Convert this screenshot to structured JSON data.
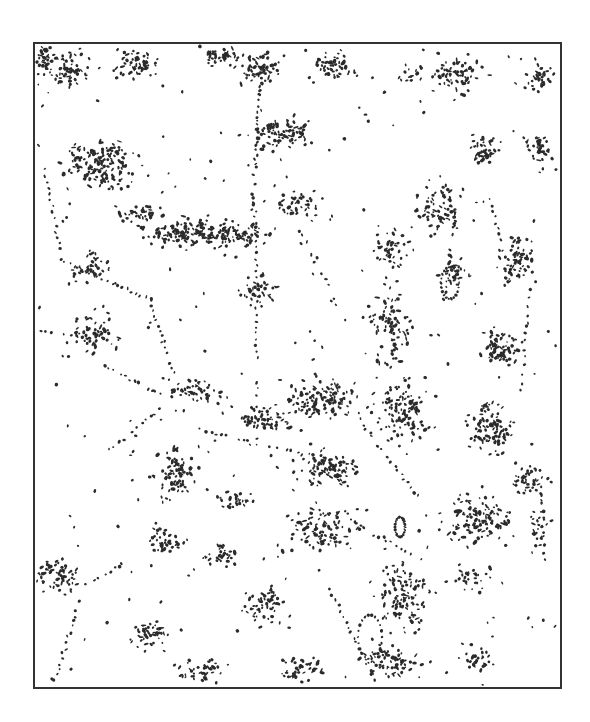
{
  "map": {
    "type": "binary-settlement-pattern",
    "frame": {
      "x": 34,
      "y": 43,
      "width": 527,
      "height": 645,
      "stroke": "#333333",
      "stroke_width": 2
    },
    "colors": {
      "background": "#ffffff",
      "ink": "#2b2b2b",
      "frame": "#333333"
    },
    "clusters": [
      {
        "cx": 100,
        "cy": 165,
        "rx": 40,
        "ry": 28,
        "n": 170
      },
      {
        "cx": 70,
        "cy": 70,
        "rx": 25,
        "ry": 20,
        "n": 60
      },
      {
        "cx": 45,
        "cy": 60,
        "rx": 10,
        "ry": 15,
        "n": 25
      },
      {
        "cx": 135,
        "cy": 62,
        "rx": 28,
        "ry": 18,
        "n": 55
      },
      {
        "cx": 220,
        "cy": 55,
        "rx": 22,
        "ry": 12,
        "n": 45
      },
      {
        "cx": 260,
        "cy": 65,
        "rx": 25,
        "ry": 20,
        "n": 55
      },
      {
        "cx": 335,
        "cy": 65,
        "rx": 25,
        "ry": 18,
        "n": 50
      },
      {
        "cx": 410,
        "cy": 75,
        "rx": 15,
        "ry": 12,
        "n": 15
      },
      {
        "cx": 455,
        "cy": 75,
        "rx": 30,
        "ry": 20,
        "n": 65
      },
      {
        "cx": 485,
        "cy": 150,
        "rx": 18,
        "ry": 15,
        "n": 45
      },
      {
        "cx": 540,
        "cy": 75,
        "rx": 15,
        "ry": 20,
        "n": 35
      },
      {
        "cx": 540,
        "cy": 150,
        "rx": 15,
        "ry": 25,
        "n": 40
      },
      {
        "cx": 190,
        "cy": 232,
        "rx": 50,
        "ry": 18,
        "n": 140
      },
      {
        "cx": 140,
        "cy": 215,
        "rx": 30,
        "ry": 14,
        "n": 40
      },
      {
        "cx": 280,
        "cy": 135,
        "rx": 30,
        "ry": 20,
        "n": 80
      },
      {
        "cx": 240,
        "cy": 235,
        "rx": 30,
        "ry": 15,
        "n": 60
      },
      {
        "cx": 300,
        "cy": 205,
        "rx": 22,
        "ry": 12,
        "n": 35
      },
      {
        "cx": 260,
        "cy": 290,
        "rx": 25,
        "ry": 20,
        "n": 40
      },
      {
        "cx": 440,
        "cy": 205,
        "rx": 25,
        "ry": 30,
        "n": 75
      },
      {
        "cx": 390,
        "cy": 250,
        "rx": 20,
        "ry": 25,
        "n": 45
      },
      {
        "cx": 515,
        "cy": 260,
        "rx": 20,
        "ry": 30,
        "n": 70
      },
      {
        "cx": 455,
        "cy": 270,
        "rx": 15,
        "ry": 20,
        "n": 30
      },
      {
        "cx": 500,
        "cy": 350,
        "rx": 22,
        "ry": 25,
        "n": 70
      },
      {
        "cx": 490,
        "cy": 430,
        "rx": 25,
        "ry": 30,
        "n": 95
      },
      {
        "cx": 390,
        "cy": 330,
        "rx": 25,
        "ry": 45,
        "n": 90
      },
      {
        "cx": 400,
        "cy": 410,
        "rx": 35,
        "ry": 35,
        "n": 120
      },
      {
        "cx": 320,
        "cy": 400,
        "rx": 45,
        "ry": 25,
        "n": 130
      },
      {
        "cx": 260,
        "cy": 420,
        "rx": 30,
        "ry": 15,
        "n": 60
      },
      {
        "cx": 330,
        "cy": 470,
        "rx": 40,
        "ry": 20,
        "n": 80
      },
      {
        "cx": 195,
        "cy": 390,
        "rx": 30,
        "ry": 15,
        "n": 55
      },
      {
        "cx": 90,
        "cy": 265,
        "rx": 25,
        "ry": 20,
        "n": 40
      },
      {
        "cx": 95,
        "cy": 335,
        "rx": 28,
        "ry": 22,
        "n": 55
      },
      {
        "cx": 175,
        "cy": 475,
        "rx": 25,
        "ry": 30,
        "n": 85
      },
      {
        "cx": 165,
        "cy": 540,
        "rx": 22,
        "ry": 18,
        "n": 40
      },
      {
        "cx": 55,
        "cy": 575,
        "rx": 25,
        "ry": 20,
        "n": 65
      },
      {
        "cx": 150,
        "cy": 635,
        "rx": 22,
        "ry": 18,
        "n": 45
      },
      {
        "cx": 220,
        "cy": 555,
        "rx": 20,
        "ry": 14,
        "n": 30
      },
      {
        "cx": 235,
        "cy": 500,
        "rx": 25,
        "ry": 10,
        "n": 25
      },
      {
        "cx": 265,
        "cy": 605,
        "rx": 25,
        "ry": 25,
        "n": 55
      },
      {
        "cx": 320,
        "cy": 530,
        "rx": 40,
        "ry": 25,
        "n": 85
      },
      {
        "cx": 405,
        "cy": 600,
        "rx": 30,
        "ry": 40,
        "n": 110
      },
      {
        "cx": 390,
        "cy": 660,
        "rx": 35,
        "ry": 18,
        "n": 70
      },
      {
        "cx": 300,
        "cy": 670,
        "rx": 30,
        "ry": 14,
        "n": 45
      },
      {
        "cx": 200,
        "cy": 670,
        "rx": 25,
        "ry": 12,
        "n": 40
      },
      {
        "cx": 480,
        "cy": 520,
        "rx": 40,
        "ry": 30,
        "n": 120
      },
      {
        "cx": 530,
        "cy": 480,
        "rx": 22,
        "ry": 20,
        "n": 45
      },
      {
        "cx": 540,
        "cy": 530,
        "rx": 12,
        "ry": 25,
        "n": 25
      },
      {
        "cx": 470,
        "cy": 580,
        "rx": 25,
        "ry": 12,
        "n": 25
      },
      {
        "cx": 475,
        "cy": 660,
        "rx": 20,
        "ry": 15,
        "n": 25
      }
    ],
    "lines": [
      {
        "x1": 262,
        "y1": 65,
        "x2": 252,
        "y2": 210,
        "n": 35
      },
      {
        "x1": 255,
        "y1": 210,
        "x2": 258,
        "y2": 450,
        "n": 40
      },
      {
        "x1": 45,
        "y1": 170,
        "x2": 60,
        "y2": 250,
        "n": 14
      },
      {
        "x1": 60,
        "y1": 260,
        "x2": 150,
        "y2": 300,
        "n": 20
      },
      {
        "x1": 150,
        "y1": 300,
        "x2": 185,
        "y2": 410,
        "n": 22
      },
      {
        "x1": 105,
        "y1": 365,
        "x2": 160,
        "y2": 395,
        "n": 14
      },
      {
        "x1": 40,
        "y1": 330,
        "x2": 95,
        "y2": 340,
        "n": 10
      },
      {
        "x1": 80,
        "y1": 600,
        "x2": 55,
        "y2": 680,
        "n": 16
      },
      {
        "x1": 95,
        "y1": 580,
        "x2": 130,
        "y2": 560,
        "n": 10
      },
      {
        "x1": 110,
        "y1": 450,
        "x2": 160,
        "y2": 410,
        "n": 12
      },
      {
        "x1": 200,
        "y1": 430,
        "x2": 330,
        "y2": 460,
        "n": 25
      },
      {
        "x1": 360,
        "y1": 420,
        "x2": 420,
        "y2": 500,
        "n": 20
      },
      {
        "x1": 330,
        "y1": 590,
        "x2": 375,
        "y2": 680,
        "n": 18
      },
      {
        "x1": 350,
        "y1": 520,
        "x2": 420,
        "y2": 560,
        "n": 15
      },
      {
        "x1": 455,
        "y1": 220,
        "x2": 445,
        "y2": 300,
        "n": 12
      },
      {
        "x1": 530,
        "y1": 290,
        "x2": 520,
        "y2": 400,
        "n": 14
      },
      {
        "x1": 540,
        "y1": 470,
        "x2": 545,
        "y2": 560,
        "n": 12
      },
      {
        "x1": 490,
        "y1": 200,
        "x2": 500,
        "y2": 240,
        "n": 8
      },
      {
        "x1": 300,
        "y1": 230,
        "x2": 340,
        "y2": 310,
        "n": 14
      }
    ],
    "ring_features": [
      {
        "cx": 450,
        "cy": 283,
        "rx": 9,
        "ry": 16
      },
      {
        "cx": 370,
        "cy": 637,
        "rx": 12,
        "ry": 22
      },
      {
        "cx": 400,
        "cy": 527,
        "rx": 5,
        "ry": 10
      }
    ],
    "scatter": {
      "n": 260,
      "seed": 7
    },
    "seed": 1337
  }
}
